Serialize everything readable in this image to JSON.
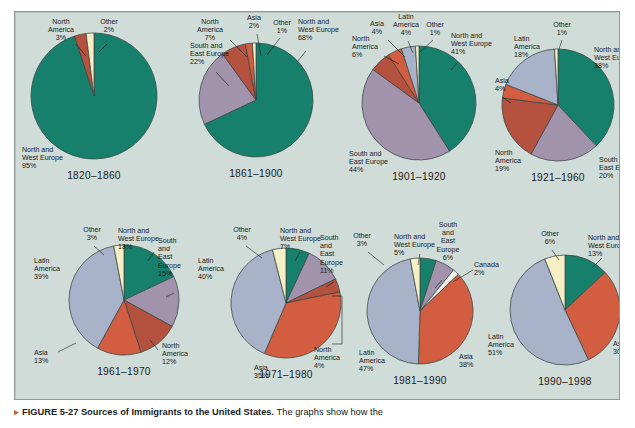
{
  "figure": {
    "bullet": "▸",
    "number": "FIGURE 5-27",
    "title": "Sources of Immigrants to the United States.",
    "body": "The graphs show how the"
  },
  "palette": {
    "background": "#cfdcd8",
    "border": "#8e9a97",
    "north_and_west_europe": "#16806c",
    "south_and_east_europe": "#a193ac",
    "north_america": "#b4513f",
    "asia": "#d25d41",
    "latin_america": "#a8b2c8",
    "other": "#f6eec4",
    "canada": "#eef0ea",
    "outline": "#3a4744",
    "text": "#1b1b1b"
  },
  "chart_data": [
    {
      "type": "pie",
      "title": "1820–1860",
      "cx": 80,
      "cy": 96,
      "r": 63,
      "start_angle": -90,
      "slices": [
        {
          "label": "North and\nWest Europe",
          "region": "North and West Europe",
          "value": 95,
          "display": "95%",
          "color_key": "north_and_west_europe",
          "label_x": 8,
          "label_y": 152,
          "anchor": "start",
          "leader": null
        },
        {
          "label": "North\nAmerica",
          "region": "North America",
          "value": 3,
          "display": "3%",
          "color_key": "north_america",
          "label_x": 47,
          "label_y": 24,
          "anchor": "middle",
          "leader": [
            [
              62,
              44
            ],
            [
              72,
              56
            ]
          ]
        },
        {
          "label": "Other",
          "region": "Other",
          "value": 2,
          "display": "2%",
          "color_key": "other",
          "label_x": 95,
          "label_y": 24,
          "anchor": "middle",
          "leader": [
            [
              93,
              44
            ],
            [
              85,
              52
            ]
          ]
        }
      ]
    },
    {
      "type": "pie",
      "title": "1861–1900",
      "cx": 242,
      "cy": 100,
      "r": 57,
      "start_angle": -90,
      "slices": [
        {
          "label": "North and\nWest Europe",
          "region": "North and West Europe",
          "value": 68,
          "display": "68%",
          "color_key": "north_and_west_europe",
          "label_x": 284,
          "label_y": 24,
          "anchor": "start",
          "leader": [
            [
              292,
              51
            ],
            [
              283,
              62
            ]
          ]
        },
        {
          "label": "South and\nEast Europe",
          "region": "South and East Europe",
          "value": 22,
          "display": "22%",
          "color_key": "south_and_east_europe",
          "label_x": 176,
          "label_y": 48,
          "anchor": "start",
          "leader": [
            [
              202,
              72
            ],
            [
              215,
              86
            ]
          ]
        },
        {
          "label": "North\nAmerica",
          "region": "North America",
          "value": 7,
          "display": "7%",
          "color_key": "north_america",
          "label_x": 196,
          "label_y": 24,
          "anchor": "middle",
          "leader": [
            [
              216,
              40
            ],
            [
              233,
              57
            ]
          ]
        },
        {
          "label": "Asia",
          "region": "Asia",
          "value": 2,
          "display": "2%",
          "color_key": "asia",
          "label_x": 240,
          "label_y": 20,
          "anchor": "middle",
          "leader": [
            [
              243,
              34
            ],
            [
              247,
              56
            ]
          ]
        },
        {
          "label": "Other",
          "region": "Other",
          "value": 1,
          "display": "1%",
          "color_key": "other",
          "label_x": 268,
          "label_y": 25,
          "anchor": "middle",
          "leader": [
            [
              266,
              38
            ],
            [
              253,
              55
            ]
          ]
        }
      ]
    },
    {
      "type": "pie",
      "title": "1901–1920",
      "cx": 405,
      "cy": 103,
      "r": 57,
      "start_angle": -90,
      "slices": [
        {
          "label": "North and\nWest Europe",
          "region": "North and West Europe",
          "value": 41,
          "display": "41%",
          "color_key": "north_and_west_europe",
          "label_x": 437,
          "label_y": 38,
          "anchor": "start",
          "leader": [
            [
              444,
              62
            ],
            [
              437,
              70
            ]
          ]
        },
        {
          "label": "South and\nEast Europe",
          "region": "South and East Europe",
          "value": 44,
          "display": "44%",
          "color_key": "south_and_east_europe",
          "label_x": 335,
          "label_y": 156,
          "anchor": "start",
          "leader": null
        },
        {
          "label": "North\nAmerica",
          "region": "North America",
          "value": 6,
          "display": "6%",
          "color_key": "north_america",
          "label_x": 338,
          "label_y": 41,
          "anchor": "start",
          "leader": [
            [
              370,
              56
            ],
            [
              385,
              64
            ]
          ]
        },
        {
          "label": "Asia",
          "region": "Asia",
          "value": 4,
          "display": "4%",
          "color_key": "asia",
          "label_x": 363,
          "label_y": 26,
          "anchor": "middle",
          "leader": [
            [
              374,
              40
            ],
            [
              391,
              57
            ]
          ]
        },
        {
          "label": "Latin\nAmerica",
          "region": "Latin America",
          "value": 4,
          "display": "4%",
          "color_key": "latin_america",
          "label_x": 392,
          "label_y": 19,
          "anchor": "middle",
          "leader": [
            [
              394,
              41
            ],
            [
              399,
              53
            ]
          ]
        },
        {
          "label": "Other",
          "region": "Other",
          "value": 1,
          "display": "1%",
          "color_key": "other",
          "label_x": 421,
          "label_y": 27,
          "anchor": "middle",
          "leader": [
            [
              419,
              40
            ],
            [
              406,
              52
            ]
          ]
        }
      ]
    },
    {
      "type": "pie",
      "title": "1921–1960",
      "cx": 544,
      "cy": 105,
      "r": 56,
      "start_angle": -90,
      "slices": [
        {
          "label": "North and\nWest Europe",
          "region": "North and West Europe",
          "value": 38,
          "display": "38%",
          "color_key": "north_and_west_europe",
          "label_x": 580,
          "label_y": 52,
          "anchor": "start",
          "leader": null
        },
        {
          "label": "South and\nEast Europe",
          "region": "South and East Europe",
          "value": 20,
          "display": "20%",
          "color_key": "south_and_east_europe",
          "label_x": 585,
          "label_y": 162,
          "anchor": "start",
          "leader": null
        },
        {
          "label": "North\nAmerica",
          "region": "North America",
          "value": 19,
          "display": "19%",
          "color_key": "north_america",
          "label_x": 481,
          "label_y": 155,
          "anchor": "start",
          "leader": null
        },
        {
          "label": "Asia",
          "region": "Asia",
          "value": 4,
          "display": "4%",
          "color_key": "asia",
          "label_x": 481,
          "label_y": 83,
          "anchor": "start",
          "leader": [
            [
              488,
              97
            ],
            [
              497,
              103
            ]
          ]
        },
        {
          "label": "Latin\nAmerica",
          "region": "Latin America",
          "value": 18,
          "display": "18%",
          "color_key": "latin_america",
          "label_x": 500,
          "label_y": 41,
          "anchor": "start",
          "leader": null
        },
        {
          "label": "Other",
          "region": "Other",
          "value": 1,
          "display": "1%",
          "color_key": "other",
          "label_x": 548,
          "label_y": 27,
          "anchor": "middle",
          "leader": [
            [
              548,
              40
            ],
            [
              545,
              49
            ]
          ]
        }
      ]
    },
    {
      "type": "pie",
      "title": "1961–1970",
      "cx": 110,
      "cy": 300,
      "r": 55,
      "start_angle": -90,
      "slices": [
        {
          "label": "North and\nWest Europe",
          "region": "North and West Europe",
          "value": 18,
          "display": "18%",
          "color_key": "north_and_west_europe",
          "label_x": 104,
          "label_y": 233,
          "anchor": "start",
          "leader": [
            [
              140,
              252
            ],
            [
              134,
              261
            ]
          ]
        },
        {
          "label": "South\nand\nEast\nEurope",
          "region": "South and East Europe",
          "value": 15,
          "display": "15%",
          "color_key": "south_and_east_europe",
          "label_x": 144,
          "label_y": 243,
          "anchor": "start",
          "leader": [
            [
              160,
              293
            ],
            [
              152,
              297
            ]
          ]
        },
        {
          "label": "North\nAmerica",
          "region": "North America",
          "value": 12,
          "display": "12%",
          "color_key": "north_america",
          "label_x": 148,
          "label_y": 348,
          "anchor": "start",
          "leader": [
            [
              144,
              350
            ],
            [
              136,
              340
            ]
          ]
        },
        {
          "label": "Asia",
          "region": "Asia",
          "value": 13,
          "display": "13%",
          "color_key": "asia",
          "label_x": 20,
          "label_y": 355,
          "anchor": "start",
          "leader": [
            [
              44,
              352
            ],
            [
              62,
              343
            ]
          ]
        },
        {
          "label": "Latin\nAmerica",
          "region": "Latin America",
          "value": 39,
          "display": "39%",
          "color_key": "latin_america",
          "label_x": 20,
          "label_y": 263,
          "anchor": "start",
          "leader": null
        },
        {
          "label": "Other",
          "region": "Other",
          "value": 3,
          "display": "3%",
          "color_key": "other",
          "label_x": 78,
          "label_y": 232,
          "anchor": "middle",
          "leader": [
            [
              80,
              246
            ],
            [
              90,
              255
            ]
          ]
        }
      ]
    },
    {
      "type": "pie",
      "title": "1971–1980",
      "cx": 272,
      "cy": 303,
      "r": 55,
      "start_angle": -90,
      "slices": [
        {
          "label": "North and\nWest Europe",
          "region": "North and West Europe",
          "value": 7,
          "display": "7%",
          "color_key": "north_and_west_europe",
          "label_x": 266,
          "label_y": 233,
          "anchor": "start",
          "leader": [
            [
              286,
              252
            ],
            [
              281,
              261
            ]
          ]
        },
        {
          "label": "South\nand\nEast\nEurope",
          "region": "South and East Europe",
          "value": 11,
          "display": "11%",
          "color_key": "south_and_east_europe",
          "label_x": 306,
          "label_y": 240,
          "anchor": "start",
          "leader": [
            [
              320,
              282
            ],
            [
              312,
              287
            ]
          ]
        },
        {
          "label": "North\nAmerica",
          "region": "North America",
          "value": 4,
          "display": "4%",
          "color_key": "north_america",
          "label_x": 300,
          "label_y": 352,
          "anchor": "start",
          "leader": null,
          "bracket": [
            [
              318,
              296
            ],
            [
              328,
              296
            ],
            [
              328,
              344
            ],
            [
              318,
              344
            ]
          ]
        },
        {
          "label": "Asia",
          "region": "Asia",
          "value": 35,
          "display": "35%",
          "color_key": "asia",
          "label_x": 240,
          "label_y": 370,
          "anchor": "start",
          "leader": null
        },
        {
          "label": "Latin\nAmerica",
          "region": "Latin America",
          "value": 40,
          "display": "40%",
          "color_key": "latin_america",
          "label_x": 184,
          "label_y": 263,
          "anchor": "start",
          "leader": null
        },
        {
          "label": "Other",
          "region": "Other",
          "value": 4,
          "display": "4%",
          "color_key": "other",
          "label_x": 228,
          "label_y": 232,
          "anchor": "middle",
          "leader": [
            [
              232,
              246
            ],
            [
              248,
              258
            ]
          ]
        }
      ]
    },
    {
      "type": "pie",
      "title": "1981–1990",
      "cx": 406,
      "cy": 311,
      "r": 53,
      "start_angle": -90,
      "slices": [
        {
          "label": "North and\nWest Europe",
          "region": "North and West Europe",
          "value": 5,
          "display": "5%",
          "color_key": "north_and_west_europe",
          "label_x": 380,
          "label_y": 239,
          "anchor": "start",
          "leader": [
            [
              406,
              254
            ],
            [
              404,
              265
            ]
          ]
        },
        {
          "label": "South\nand\nEast\nEurope",
          "region": "South and East Europe",
          "value": 6,
          "display": "6%",
          "color_key": "south_and_east_europe",
          "label_x": 434,
          "label_y": 227,
          "anchor": "middle",
          "leader": [
            [
              428,
              280
            ],
            [
              421,
              288
            ]
          ]
        },
        {
          "label": "Canada",
          "region": "Canada",
          "value": 2,
          "display": "2%",
          "color_key": "canada",
          "label_x": 460,
          "label_y": 267,
          "anchor": "start",
          "leader": [
            [
              459,
              270
            ],
            [
              439,
              282
            ]
          ]
        },
        {
          "label": "Asia",
          "region": "Asia",
          "value": 38,
          "display": "38%",
          "color_key": "asia",
          "label_x": 445,
          "label_y": 359,
          "anchor": "start",
          "leader": null
        },
        {
          "label": "Latin\nAmerica",
          "region": "Latin America",
          "value": 47,
          "display": "47%",
          "color_key": "latin_america",
          "label_x": 345,
          "label_y": 355,
          "anchor": "start",
          "leader": null
        },
        {
          "label": "Other",
          "region": "Other",
          "value": 3,
          "display": "3%",
          "color_key": "other",
          "label_x": 348,
          "label_y": 238,
          "anchor": "middle",
          "leader": [
            [
              354,
              252
            ],
            [
              370,
              265
            ]
          ]
        }
      ]
    },
    {
      "type": "pie",
      "title": "1990–1998",
      "cx": 551,
      "cy": 310,
      "r": 55,
      "start_angle": -90,
      "slices": [
        {
          "label": "North and\nWest Europe",
          "region": "North and West Europe",
          "value": 13,
          "display": "13%",
          "color_key": "north_and_west_europe",
          "label_x": 574,
          "label_y": 240,
          "anchor": "start",
          "leader": [
            [
              588,
              258
            ],
            [
              578,
              268
            ]
          ]
        },
        {
          "label": "Asia",
          "region": "Asia",
          "value": 30,
          "display": "30%",
          "color_key": "asia",
          "label_x": 599,
          "label_y": 346,
          "anchor": "start",
          "leader": null
        },
        {
          "label": "Latin\nAmerica",
          "region": "Latin America",
          "value": 51,
          "display": "51%",
          "color_key": "latin_america",
          "label_x": 474,
          "label_y": 339,
          "anchor": "start",
          "leader": null
        },
        {
          "label": "Other",
          "region": "Other",
          "value": 6,
          "display": "6%",
          "color_key": "other",
          "label_x": 536,
          "label_y": 236,
          "anchor": "middle",
          "leader": [
            [
              538,
              250
            ],
            [
              545,
              260
            ]
          ]
        }
      ]
    }
  ]
}
